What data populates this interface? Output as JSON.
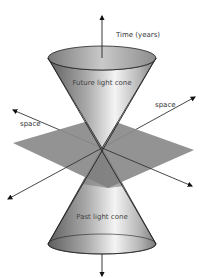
{
  "diagram": {
    "type": "spacetime-light-cone",
    "labels": {
      "time_axis": "Time (years)",
      "future_cone": "Future light cone",
      "past_cone": "Past light cone",
      "space_left": "space",
      "space_right": "space"
    },
    "colors": {
      "background": "#ffffff",
      "plane": "#8a8a8a",
      "cone_dark": "#6f6f6f",
      "cone_light": "#f2f2f2",
      "axis": "#222222"
    },
    "geometry": {
      "apex": [
        102,
        148
      ],
      "time_arrow_top": [
        102,
        14
      ],
      "time_arrow_bottom": [
        102,
        278
      ],
      "future_cone_rim": {
        "cx": 102,
        "cy": 58,
        "rx": 54,
        "ry": 12
      },
      "past_cone_rim": {
        "cx": 102,
        "cy": 244,
        "rx": 54,
        "ry": 10
      },
      "plane": [
        [
          13,
          143
        ],
        [
          102,
          117
        ],
        [
          194,
          150
        ],
        [
          108,
          188
        ]
      ]
    }
  }
}
